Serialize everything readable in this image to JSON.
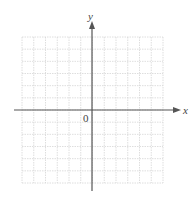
{
  "figure": {
    "type": "coordinate-grid",
    "x_axis_label": "x",
    "y_axis_label": "y",
    "origin_label": "0",
    "grid": {
      "columns": 12,
      "rows": 12,
      "columns_left_of_origin": 6,
      "columns_right_of_origin": 6,
      "rows_above_origin": 6,
      "rows_below_origin": 6
    },
    "colors": {
      "axis": "#555555",
      "grid": "#d6d6d6",
      "label": "#444444"
    }
  }
}
